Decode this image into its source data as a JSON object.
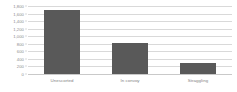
{
  "chart_data": {
    "type": "bar",
    "title": "",
    "subtitle": "",
    "xlabel": "",
    "ylabel": "",
    "categories": [
      "Unescorted",
      "In convoy",
      "Straggling"
    ],
    "values": [
      1700,
      820,
      280
    ],
    "series": [
      {
        "name": "Ships lost",
        "values": [
          1700,
          820,
          280
        ]
      }
    ],
    "ylim": [
      0,
      1800
    ],
    "y_tick_step": 200,
    "y_tick_labels": [
      "1,800",
      "1,600",
      "1,400",
      "1,200",
      "1,000",
      "800",
      "600",
      "400",
      "200",
      "0"
    ],
    "y_tick_values": [
      1800,
      1600,
      1400,
      1200,
      1000,
      800,
      600,
      400,
      200,
      0
    ],
    "grid": true,
    "grid_axis": "y",
    "legend": false,
    "legend_position": "none",
    "annotations": [],
    "colors": {
      "bar": "#595959",
      "gridline": "#d9d9d9",
      "axis_line": "#c9c9c9",
      "tick_label": "#8c8c8c",
      "category_label": "#7f7f7f",
      "background": "#ffffff"
    }
  }
}
